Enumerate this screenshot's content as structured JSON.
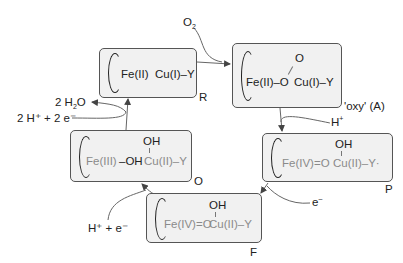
{
  "diagram": {
    "type": "catalytic cycle",
    "states": [
      {
        "id": "R",
        "label": "R",
        "fe": "Fe(II)",
        "cu": "Cu(I)–Y"
      },
      {
        "id": "A",
        "label": "'oxy' (A)",
        "fe": "Fe(II)–O",
        "top": "O",
        "cu": "Cu(I)–Y"
      },
      {
        "id": "P",
        "label": "P",
        "fe": "Fe(IV)=O",
        "top": "OH",
        "cu": "Cu(II)–Y·"
      },
      {
        "id": "F",
        "label": "F",
        "fe": "Fe(IV)=O",
        "top": "OH",
        "cu": "Cu(II)–Y"
      },
      {
        "id": "O",
        "label": "O",
        "fe_a": "Fe(III)",
        "fe_b": "–OH",
        "top": "OH",
        "cu": "Cu(II)–Y"
      }
    ],
    "inputs": {
      "o2": {
        "main": "O",
        "sub": "2"
      },
      "h_plus_A": {
        "main": "H",
        "sup": "+"
      },
      "e_minus_P": {
        "main": "e",
        "sup": "–"
      },
      "h_e_F": {
        "text": "H⁺ + e⁻"
      },
      "h2e2_O": {
        "text": "2 H⁺ + 2 e⁻"
      },
      "water_out": {
        "pre": "2 H",
        "sub": "2",
        "post": "O"
      }
    },
    "colors": {
      "box_fill": "#f1f1f1",
      "box_border": "#555555",
      "gray_text": "#8a8a8a",
      "dark_text": "#222222",
      "arrow": "#555555"
    }
  }
}
